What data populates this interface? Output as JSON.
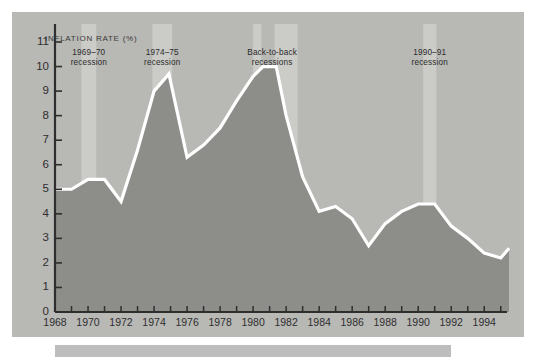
{
  "figure": {
    "panel_bg": "#b8b8b5",
    "area_fill": "#8d8d8a",
    "line_color": "#ffffff",
    "band_color": "#cbcbc8",
    "axis_color": "#2e2e2e",
    "caption_bar_color": "#bdbdbd",
    "caption_text": ""
  },
  "chart_data": {
    "type": "area",
    "title": "",
    "subtitle": "",
    "xlabel": "",
    "ylabel": "INFLATION RATE (%)",
    "ylim": [
      0,
      11
    ],
    "xlim": [
      1968,
      1995.5
    ],
    "grid": false,
    "legend": "none",
    "ytick_labels": [
      "0",
      "1",
      "2",
      "3",
      "4",
      "5",
      "6",
      "7",
      "8",
      "9",
      "10",
      "11"
    ],
    "ytick_values": [
      0,
      1,
      2,
      3,
      4,
      5,
      6,
      7,
      8,
      9,
      10,
      11
    ],
    "xtick_labels": [
      "1968",
      "1970",
      "1972",
      "1974",
      "1976",
      "1978",
      "1980",
      "1982",
      "1984",
      "1986",
      "1988",
      "1990",
      "1992",
      "1994"
    ],
    "xtick_values": [
      1968,
      1970,
      1972,
      1974,
      1976,
      1978,
      1980,
      1982,
      1984,
      1986,
      1988,
      1990,
      1992,
      1994
    ],
    "xminor_step": 1,
    "series": [
      {
        "name": "Inflation rate",
        "x": [
          1968.0,
          1969.0,
          1970.0,
          1971.0,
          1972.0,
          1973.0,
          1974.0,
          1974.9,
          1976.0,
          1977.0,
          1978.0,
          1979.0,
          1980.0,
          1980.6,
          1981.4,
          1982.0,
          1983.0,
          1984.0,
          1985.0,
          1986.0,
          1987.0,
          1988.0,
          1989.0,
          1990.0,
          1991.0,
          1992.0,
          1993.0,
          1994.0,
          1995.0,
          1995.5
        ],
        "y": [
          5.0,
          5.0,
          5.4,
          5.4,
          4.5,
          6.6,
          9.0,
          9.7,
          6.3,
          6.8,
          7.5,
          8.6,
          9.6,
          10.0,
          10.0,
          8.0,
          5.5,
          4.1,
          4.3,
          3.8,
          2.7,
          3.6,
          4.1,
          4.4,
          4.4,
          3.5,
          3.0,
          2.4,
          2.2,
          2.6
        ]
      }
    ],
    "recession_bands": [
      {
        "label": "1969–70\nrecession",
        "start": 1969.6,
        "end": 1970.5,
        "label_x": 1970.05,
        "label_y": 10.6
      },
      {
        "label": "1974–75\nrecession",
        "start": 1973.9,
        "end": 1975.1,
        "label_x": 1974.5,
        "label_y": 10.6
      },
      {
        "label": "Back-to-back\nrecessions",
        "start": 1980.0,
        "end": 1980.5,
        "label_x": 1981.15,
        "label_y": 10.6
      },
      {
        "label": "",
        "start": 1981.3,
        "end": 1982.7,
        "label_x": 0,
        "label_y": 0
      },
      {
        "label": "1990–91\nrecession",
        "start": 1990.3,
        "end": 1991.1,
        "label_x": 1990.7,
        "label_y": 10.6
      }
    ]
  }
}
